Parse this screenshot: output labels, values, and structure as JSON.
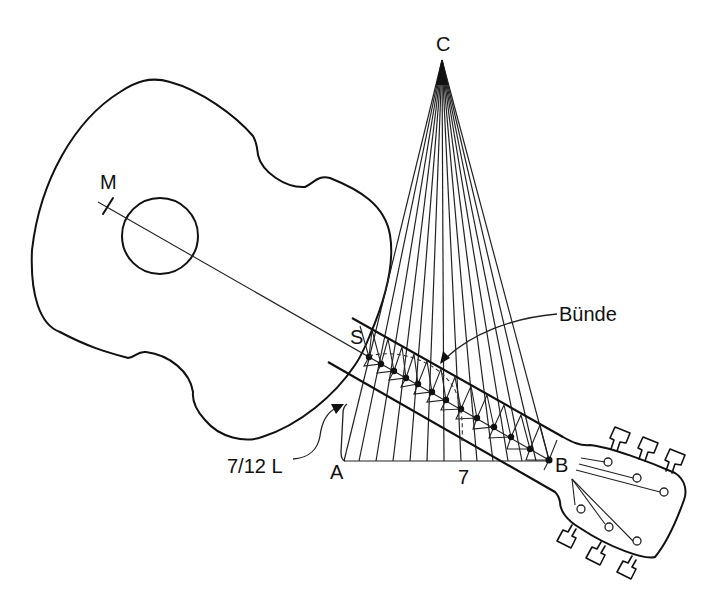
{
  "diagram": {
    "type": "guitar fret construction diagram",
    "labels": {
      "apex": "C",
      "midpoint": "M",
      "saddle_point": "S",
      "base_left": "A",
      "base_right": "B",
      "base_length": "7",
      "length_annotation": "7/12 L",
      "frets_annotation": "Bünde"
    },
    "points": {
      "C": [
        442,
        60
      ],
      "A": [
        344,
        461
      ],
      "B": [
        549,
        460
      ],
      "M": [
        108,
        206
      ],
      "S": [
        369,
        357
      ]
    },
    "ray_count": 14,
    "fret_dot_count": 13,
    "colors": {
      "line": "#111111",
      "background": "#ffffff"
    }
  }
}
